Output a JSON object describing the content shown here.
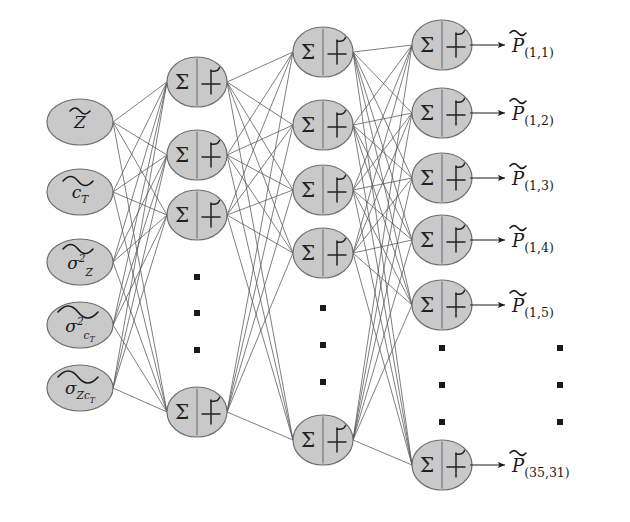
{
  "figure": {
    "type": "neural-network-architecture-diagram",
    "background_color": "#ffffff",
    "node_fill": "#c9c9c9",
    "node_stroke": "#6e6e6e",
    "edge_color": "#555555",
    "text_color": "#1a1a1a",
    "ellipsis_glyph": "■"
  },
  "layers": [
    {
      "name": "input-layer",
      "kind": "input",
      "node_shape": "ellipse",
      "visible_node_count": 5,
      "nodes": [
        {
          "id": "in-1",
          "label": "Z",
          "accent": "tilde",
          "sub": "",
          "sup": "",
          "cx": 80,
          "cy": 122
        },
        {
          "id": "in-2",
          "label": "c",
          "accent": "tilde",
          "sub": "T",
          "sup": "",
          "cx": 80,
          "cy": 192
        },
        {
          "id": "in-3",
          "label": "σ",
          "accent": "tilde",
          "sub": "Z",
          "sup": "2",
          "cx": 80,
          "cy": 262
        },
        {
          "id": "in-4",
          "label": "σ",
          "accent": "tilde",
          "sub": "c_T",
          "sup": "2",
          "cx": 80,
          "cy": 325
        },
        {
          "id": "in-5",
          "label": "σ",
          "accent": "tilde",
          "sub": "Zc_T",
          "sup": "",
          "cx": 80,
          "cy": 388
        }
      ]
    },
    {
      "name": "hidden-layer-1",
      "kind": "hidden",
      "node_shape": "ellipse",
      "neuron_left_symbol": "Σ",
      "neuron_right_symbol": "activation-function",
      "visible_node_count": 4,
      "nodes": [
        {
          "id": "h1-1",
          "cx": 197,
          "cy": 82
        },
        {
          "id": "h1-2",
          "cx": 197,
          "cy": 155
        },
        {
          "id": "h1-3",
          "cx": 197,
          "cy": 215
        },
        {
          "id": "h1-last",
          "cx": 197,
          "cy": 412
        }
      ],
      "ellipsis": {
        "x": 197,
        "y_positions": [
          277,
          313,
          350
        ]
      }
    },
    {
      "name": "hidden-layer-2",
      "kind": "hidden",
      "node_shape": "ellipse",
      "neuron_left_symbol": "Σ",
      "neuron_right_symbol": "activation-function",
      "visible_node_count": 5,
      "nodes": [
        {
          "id": "h2-1",
          "cx": 323,
          "cy": 52
        },
        {
          "id": "h2-2",
          "cx": 323,
          "cy": 125
        },
        {
          "id": "h2-3",
          "cx": 323,
          "cy": 190
        },
        {
          "id": "h2-4",
          "cx": 323,
          "cy": 253
        },
        {
          "id": "h2-last",
          "cx": 323,
          "cy": 440
        }
      ],
      "ellipsis": {
        "x": 323,
        "y_positions": [
          308,
          345,
          382
        ]
      }
    },
    {
      "name": "output-layer",
      "kind": "output",
      "node_shape": "ellipse",
      "neuron_left_symbol": "Σ",
      "neuron_right_symbol": "activation-function",
      "visible_node_count": 6,
      "nodes": [
        {
          "id": "out-1",
          "cx": 442,
          "cy": 45
        },
        {
          "id": "out-2",
          "cx": 442,
          "cy": 113
        },
        {
          "id": "out-3",
          "cx": 442,
          "cy": 178
        },
        {
          "id": "out-4",
          "cx": 442,
          "cy": 240
        },
        {
          "id": "out-5",
          "cx": 442,
          "cy": 305
        },
        {
          "id": "out-last",
          "cx": 442,
          "cy": 465
        }
      ],
      "ellipsis": {
        "x": 442,
        "y_positions": [
          348,
          385,
          422
        ]
      }
    }
  ],
  "outputs": {
    "arrow_color": "#3a3a3a",
    "labels": [
      {
        "id": "p-1-1",
        "symbol": "P",
        "accent": "tilde",
        "subscript": "(1,1)",
        "x": 512,
        "y": 45,
        "arrow_from": 470,
        "arrow_to": 505
      },
      {
        "id": "p-1-2",
        "symbol": "P",
        "accent": "tilde",
        "subscript": "(1,2)",
        "x": 512,
        "y": 113,
        "arrow_from": 470,
        "arrow_to": 505
      },
      {
        "id": "p-1-3",
        "symbol": "P",
        "accent": "tilde",
        "subscript": "(1,3)",
        "x": 512,
        "y": 178,
        "arrow_from": 470,
        "arrow_to": 505
      },
      {
        "id": "p-1-4",
        "symbol": "P",
        "accent": "tilde",
        "subscript": "(1,4)",
        "x": 512,
        "y": 240,
        "arrow_from": 470,
        "arrow_to": 505
      },
      {
        "id": "p-1-5",
        "symbol": "P",
        "accent": "tilde",
        "subscript": "(1,5)",
        "x": 512,
        "y": 305,
        "arrow_from": 470,
        "arrow_to": 505
      },
      {
        "id": "p-35-31",
        "symbol": "P",
        "accent": "tilde",
        "subscript": "(35,31)",
        "x": 512,
        "y": 465,
        "arrow_from": 470,
        "arrow_to": 505
      }
    ],
    "ellipsis": {
      "x": 560,
      "y_positions": [
        348,
        385,
        422
      ]
    }
  },
  "connections": {
    "input_to_hidden1": "fully-connected",
    "hidden1_to_hidden2": "fully-connected",
    "hidden2_to_output": "fully-connected"
  }
}
